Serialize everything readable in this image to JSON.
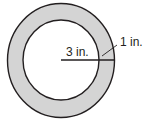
{
  "diagram": {
    "type": "annulus",
    "colors": {
      "ring_fill": "#d4d4d4",
      "stroke": "#231f20",
      "background": "#ffffff"
    },
    "labels": {
      "inner_radius": "3 in.",
      "ring_width": "1 in."
    }
  }
}
